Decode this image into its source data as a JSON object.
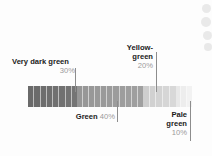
{
  "chart_data": {
    "type": "bar",
    "title": "",
    "subtitle": "",
    "xlabel": "",
    "ylabel": "",
    "orientation": "horizontal-stacked",
    "grid": false,
    "legend_position": "callout-labels",
    "categories": [
      "Very dark green",
      "Green",
      "Yellow-green",
      "Pale green"
    ],
    "values": [
      30,
      40,
      20,
      10
    ],
    "value_labels": [
      "30%",
      "40%",
      "20%",
      "10%"
    ],
    "units": "percent",
    "total": 100,
    "segment_fills": [
      "#6f6f6f",
      "#9b9b9b",
      "#d3d3d3",
      "#ededed"
    ],
    "stripe_counts": [
      8,
      11,
      5,
      3
    ]
  },
  "labels": {
    "very_dark_green": {
      "name": "Very dark green",
      "percent": "30%"
    },
    "yellow_green": {
      "name_line1": "Yellow-",
      "name_line2": "green",
      "percent": "20%"
    },
    "green": {
      "name": "Green",
      "percent": "40%"
    },
    "pale_green": {
      "name_line1": "Pale",
      "name_line2": "green",
      "percent": "10%"
    }
  },
  "colors": {
    "text": "#1b1b1b",
    "percent_text": "#9a9a9a",
    "leader_line": "#8d8d8d",
    "background": "#fdfdfd"
  }
}
